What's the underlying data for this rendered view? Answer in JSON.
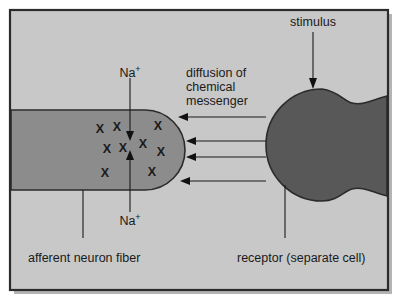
{
  "figure": {
    "background_color": "#c8c8c8",
    "frame_color": "#2b2b2b",
    "page_color": "#ffffff",
    "shadow_color": "#b0b0b0",
    "neuron_color": "#8c8c8c",
    "receptor_color": "#585858",
    "ink_color": "#1a1a1a"
  },
  "labels": {
    "stimulus": "stimulus",
    "diffusion_line1": "diffusion of",
    "diffusion_line2": "chemical",
    "diffusion_line3": "messenger",
    "sodium_top_base": "Na",
    "sodium_top_charge": "+",
    "sodium_bottom_base": "Na",
    "sodium_bottom_charge": "+",
    "afferent_neuron_fiber": "afferent neuron fiber",
    "receptor": "receptor (separate cell)"
  },
  "ion_marks": {
    "glyph": "X",
    "count": 9,
    "positions": [
      {
        "x": 100,
        "y": 133
      },
      {
        "x": 117,
        "y": 131
      },
      {
        "x": 158,
        "y": 130
      },
      {
        "x": 107,
        "y": 153
      },
      {
        "x": 123,
        "y": 152
      },
      {
        "x": 143,
        "y": 148
      },
      {
        "x": 161,
        "y": 156
      },
      {
        "x": 105,
        "y": 177
      },
      {
        "x": 152,
        "y": 176
      }
    ]
  },
  "diffusion_arrows": {
    "count": 4,
    "description": "chemical messenger diffusing from receptor cell to afferent neuron fiber",
    "arrows": [
      {
        "x_start": 262,
        "y_start": 117,
        "x_end": 180,
        "y_end": 117
      },
      {
        "x_start": 262,
        "y_start": 141,
        "x_end": 187,
        "y_end": 141
      },
      {
        "x_start": 262,
        "y_start": 157,
        "x_end": 187,
        "y_end": 157
      },
      {
        "x_start": 262,
        "y_start": 181,
        "x_end": 181,
        "y_end": 181
      }
    ]
  },
  "sodium_flow": {
    "inward_arrow": {
      "x": 130,
      "y_start": 78,
      "y_end": 139
    },
    "outward_arrow": {
      "x": 130,
      "y_start": 212,
      "y_end": 152
    }
  },
  "stimulus_arrow": {
    "x": 313,
    "y_start": 32,
    "y_end": 88
  },
  "leader_lines": [
    {
      "name": "afferent-neuron-fiber-leader",
      "x": 83,
      "y_start": 238,
      "y_end": 190
    },
    {
      "name": "receptor-leader",
      "x": 285,
      "y_start": 238,
      "y_end": 185
    }
  ]
}
